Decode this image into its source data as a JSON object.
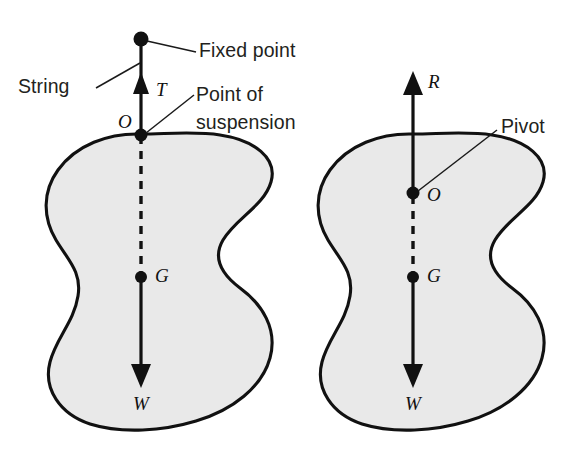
{
  "figure": {
    "background_color": "#ffffff",
    "body_fill_color": "#e9e9e9",
    "outline_color": "#111111",
    "panels": [
      {
        "id": "left-panel",
        "name": "suspended-body-diagram",
        "callouts": [
          {
            "id": "fixed-point",
            "label": "Fixed point"
          },
          {
            "id": "string",
            "label": "String"
          },
          {
            "id": "point-of-suspension",
            "label": "Point of",
            "label_line2": "suspension"
          }
        ],
        "points": [
          {
            "id": "suspension-point",
            "label": "O"
          },
          {
            "id": "centre-of-gravity",
            "label": "G"
          }
        ],
        "forces": [
          {
            "id": "tension",
            "label": "T",
            "direction": "up"
          },
          {
            "id": "weight",
            "label": "W",
            "direction": "down"
          }
        ]
      },
      {
        "id": "right-panel",
        "name": "pivoted-body-diagram",
        "callouts": [
          {
            "id": "pivot",
            "label": "Pivot"
          }
        ],
        "points": [
          {
            "id": "pivot-point",
            "label": "O"
          },
          {
            "id": "centre-of-gravity",
            "label": "G"
          }
        ],
        "forces": [
          {
            "id": "reaction",
            "label": "R",
            "direction": "up"
          },
          {
            "id": "weight",
            "label": "W",
            "direction": "down"
          }
        ]
      }
    ]
  }
}
